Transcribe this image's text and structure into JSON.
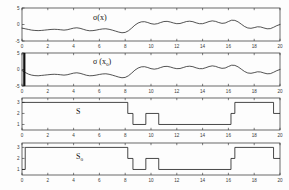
{
  "figure": {
    "title": "",
    "panel_count": 4,
    "background_color": "#fdfdfd",
    "line_color": "#1b1b1b",
    "axis_color": "#2a2a2a"
  },
  "chart_data": [
    {
      "type": "line",
      "panel_index": 0,
      "title": "σ(x)",
      "label_text": "σ(x)",
      "xlabel": "",
      "ylabel": "",
      "xlim": [
        0,
        20
      ],
      "ylim": [
        -5,
        5
      ],
      "xticks": [
        0,
        2,
        4,
        6,
        8,
        10,
        12,
        14,
        16,
        18,
        20
      ],
      "yticks": [
        -5,
        0,
        5
      ],
      "xticklabels": [
        "0",
        "2",
        "4",
        "6",
        "8",
        "10",
        "12",
        "14",
        "16",
        "18",
        "20"
      ],
      "yticklabels": [
        "-5",
        "0",
        "5"
      ],
      "grid": false,
      "legend": null,
      "series": [
        {
          "name": "sigma_x",
          "x": [
            0.0,
            0.25,
            0.5,
            0.75,
            1.0,
            1.25,
            1.5,
            1.75,
            2.0,
            2.25,
            2.5,
            2.75,
            3.0,
            3.25,
            3.5,
            3.75,
            4.0,
            4.25,
            4.5,
            4.75,
            5.0,
            5.25,
            5.5,
            5.75,
            6.0,
            6.25,
            6.5,
            6.75,
            7.0,
            7.25,
            7.5,
            7.75,
            8.0,
            8.25,
            8.5,
            8.75,
            9.0,
            9.25,
            9.5,
            9.75,
            10.0,
            10.25,
            10.5,
            10.75,
            11.0,
            11.25,
            11.5,
            11.75,
            12.0,
            12.25,
            12.5,
            12.75,
            13.0,
            13.25,
            13.5,
            13.75,
            14.0,
            14.25,
            14.5,
            14.75,
            15.0,
            15.25,
            15.5,
            15.75,
            16.0,
            16.25,
            16.5,
            16.75,
            17.0,
            17.25,
            17.5,
            17.75,
            18.0,
            18.25,
            18.5,
            18.75,
            19.0,
            19.25,
            19.5,
            19.75,
            20.0
          ],
          "y": [
            -1.1,
            -1.3,
            -1.5,
            -1.7,
            -1.8,
            -1.85,
            -1.8,
            -1.7,
            -1.6,
            -1.5,
            -1.45,
            -1.5,
            -1.6,
            -1.7,
            -1.6,
            -1.35,
            -1.1,
            -1.0,
            -1.15,
            -1.45,
            -1.75,
            -1.9,
            -1.85,
            -1.7,
            -1.5,
            -1.35,
            -1.3,
            -1.45,
            -1.7,
            -2.0,
            -2.3,
            -2.5,
            -2.4,
            -1.9,
            -1.1,
            -0.2,
            0.45,
            0.8,
            0.85,
            0.6,
            0.25,
            0.1,
            0.25,
            0.6,
            0.9,
            0.95,
            0.75,
            0.45,
            0.25,
            0.3,
            0.6,
            0.9,
            1.0,
            0.85,
            0.5,
            0.25,
            0.25,
            0.55,
            0.9,
            1.1,
            0.95,
            0.6,
            0.35,
            0.45,
            0.9,
            1.3,
            1.25,
            0.8,
            0.1,
            -0.6,
            -1.05,
            -1.15,
            -0.95,
            -0.7,
            -0.75,
            -1.05,
            -1.3,
            -1.25,
            -0.85,
            -0.35,
            0.0
          ]
        }
      ]
    },
    {
      "type": "line",
      "panel_index": 1,
      "title": "σ(xₒ)",
      "label_text": "σ (x",
      "label_sub": "o",
      "label_tail": ")",
      "xlabel": "",
      "ylabel": "",
      "xlim": [
        0,
        20
      ],
      "ylim": [
        -5,
        5
      ],
      "xticks": [
        0,
        2,
        4,
        6,
        8,
        10,
        12,
        14,
        16,
        18,
        20
      ],
      "yticks": [
        -5,
        0,
        5
      ],
      "xticklabels": [
        "0",
        "2",
        "4",
        "6",
        "8",
        "10",
        "12",
        "14",
        "16",
        "18",
        "20"
      ],
      "yticklabels": [
        "-5",
        "0",
        "5"
      ],
      "grid": false,
      "legend": null,
      "marker_bar": {
        "x": 0.18,
        "y_from": -5.0,
        "y_to": 5.0,
        "note": "thick vertical bar at left edge"
      },
      "series": [
        {
          "name": "sigma_x0",
          "x": [
            0.0,
            0.25,
            0.5,
            0.75,
            1.0,
            1.25,
            1.5,
            1.75,
            2.0,
            2.25,
            2.5,
            2.75,
            3.0,
            3.25,
            3.5,
            3.75,
            4.0,
            4.25,
            4.5,
            4.75,
            5.0,
            5.25,
            5.5,
            5.75,
            6.0,
            6.25,
            6.5,
            6.75,
            7.0,
            7.25,
            7.5,
            7.75,
            8.0,
            8.25,
            8.5,
            8.75,
            9.0,
            9.25,
            9.5,
            9.75,
            10.0,
            10.25,
            10.5,
            10.75,
            11.0,
            11.25,
            11.5,
            11.75,
            12.0,
            12.25,
            12.5,
            12.75,
            13.0,
            13.25,
            13.5,
            13.75,
            14.0,
            14.25,
            14.5,
            14.75,
            15.0,
            15.25,
            15.5,
            15.75,
            16.0,
            16.25,
            16.5,
            16.75,
            17.0,
            17.25,
            17.5,
            17.75,
            18.0,
            18.25,
            18.5,
            18.75,
            19.0,
            19.25,
            19.5,
            19.75,
            20.0
          ],
          "y": [
            -0.3,
            -0.9,
            -1.4,
            -1.7,
            -1.85,
            -1.9,
            -1.8,
            -1.7,
            -1.6,
            -1.5,
            -1.45,
            -1.5,
            -1.6,
            -1.7,
            -1.6,
            -1.35,
            -1.1,
            -1.0,
            -1.15,
            -1.45,
            -1.75,
            -1.9,
            -1.85,
            -1.7,
            -1.5,
            -1.35,
            -1.3,
            -1.45,
            -1.7,
            -2.0,
            -2.3,
            -2.5,
            -2.4,
            -1.9,
            -1.1,
            -0.2,
            0.45,
            0.8,
            0.85,
            0.6,
            0.25,
            0.1,
            0.25,
            0.6,
            0.9,
            0.95,
            0.75,
            0.45,
            0.25,
            0.3,
            0.6,
            0.9,
            1.0,
            0.85,
            0.5,
            0.25,
            0.25,
            0.55,
            0.9,
            1.1,
            0.95,
            0.6,
            0.35,
            0.45,
            0.9,
            1.3,
            1.25,
            0.8,
            0.1,
            -0.6,
            -1.05,
            -1.15,
            -0.95,
            -0.7,
            -0.75,
            -1.05,
            -1.3,
            -1.25,
            -0.85,
            -0.35,
            0.0
          ]
        }
      ]
    },
    {
      "type": "line",
      "panel_index": 2,
      "title": "S",
      "label_text": "S",
      "xlabel": "",
      "ylabel": "",
      "xlim": [
        0,
        20
      ],
      "ylim": [
        0.5,
        3.4
      ],
      "xticks": [
        0,
        2,
        4,
        6,
        8,
        10,
        12,
        14,
        16,
        18,
        20
      ],
      "yticks": [
        1,
        2,
        3
      ],
      "xticklabels": [
        "0",
        "2",
        "4",
        "6",
        "8",
        "10",
        "12",
        "14",
        "16",
        "18",
        "20"
      ],
      "yticklabels": [
        "1",
        "2",
        "3"
      ],
      "grid": false,
      "legend": null,
      "step_style": "post",
      "series": [
        {
          "name": "S",
          "x": [
            0.0,
            8.2,
            8.2,
            8.6,
            8.6,
            9.6,
            9.6,
            10.6,
            10.6,
            16.2,
            16.2,
            16.5,
            16.5,
            19.5,
            19.5,
            20.0
          ],
          "y": [
            3.0,
            3.0,
            2.0,
            2.0,
            1.0,
            1.0,
            2.0,
            2.0,
            1.0,
            1.0,
            2.0,
            2.0,
            3.0,
            3.0,
            2.0,
            2.0
          ]
        }
      ]
    },
    {
      "type": "line",
      "panel_index": 3,
      "title": "Sₒ",
      "label_text": "S",
      "label_sub": "o",
      "xlabel": "",
      "ylabel": "",
      "xlim": [
        0,
        20
      ],
      "ylim": [
        0.5,
        3.4
      ],
      "xticks": [
        0,
        2,
        4,
        6,
        8,
        10,
        12,
        14,
        16,
        18,
        20
      ],
      "yticks": [
        1,
        2,
        3
      ],
      "xticklabels": [
        "0",
        "2",
        "4",
        "6",
        "8",
        "10",
        "12",
        "14",
        "16",
        "18",
        "20"
      ],
      "yticklabels": [
        "1",
        "2",
        "3"
      ],
      "grid": false,
      "legend": null,
      "step_style": "post",
      "series": [
        {
          "name": "S_o",
          "x": [
            0.0,
            0.25,
            0.25,
            8.2,
            8.2,
            8.6,
            8.6,
            9.6,
            9.6,
            10.6,
            10.6,
            16.2,
            16.2,
            16.5,
            16.5,
            19.5,
            19.5,
            20.0
          ],
          "y": [
            1.0,
            1.0,
            3.0,
            3.0,
            2.0,
            2.0,
            1.0,
            1.0,
            2.0,
            2.0,
            1.0,
            1.0,
            2.0,
            2.0,
            3.0,
            3.0,
            2.0,
            2.0
          ]
        }
      ]
    }
  ]
}
